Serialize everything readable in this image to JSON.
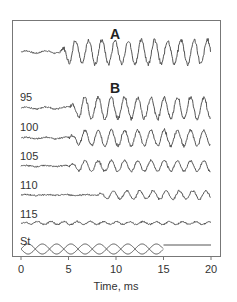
{
  "chart_data": {
    "type": "line",
    "title": "",
    "panels": [
      "A",
      "B"
    ],
    "xlabel": "Time, ms",
    "ylabel": "",
    "xlim": [
      0,
      20
    ],
    "xticks": [
      0,
      5,
      10,
      15,
      20
    ],
    "grid": false,
    "legend": "none",
    "series": [
      {
        "name": "A",
        "description": "response waveform: low noise until ~4 ms, then large oscillation at ~1.4 kHz, amplitude ~ +/-1",
        "amplitude": 1.0,
        "onset_ms": 4.0
      },
      {
        "name": "95",
        "description": "level 95: periodic oscillation after ~5 ms",
        "amplitude": 0.9,
        "onset_ms": 5.0
      },
      {
        "name": "100",
        "description": "level 100: periodic oscillation after ~5 ms",
        "amplitude": 0.65,
        "onset_ms": 5.0
      },
      {
        "name": "105",
        "description": "level 105: smaller oscillation",
        "amplitude": 0.45,
        "onset_ms": 5.0
      },
      {
        "name": "110",
        "description": "level 110: small irregular oscillation",
        "amplitude": 0.35,
        "onset_ms": 8.0
      },
      {
        "name": "115",
        "description": "level 115: near-flat trace",
        "amplitude": 0.12,
        "onset_ms": 0.0
      },
      {
        "name": "St",
        "description": "stimulus: amplitude-modulated tone bursts 0-15 ms, flat after 15 ms",
        "amplitude": 0.5,
        "offset_ms": 15.0
      }
    ]
  },
  "labels": {
    "panel_a": "A",
    "panel_b": "B",
    "trace_95": "95",
    "trace_100": "100",
    "trace_105": "105",
    "trace_110": "110",
    "trace_115": "115",
    "trace_st": "St",
    "tick_0": "0",
    "tick_5": "5",
    "tick_10": "10",
    "tick_15": "15",
    "tick_20": "20",
    "xlabel": "Time, ms"
  },
  "colors": {
    "trace": "#555555",
    "frame": "#777777"
  }
}
